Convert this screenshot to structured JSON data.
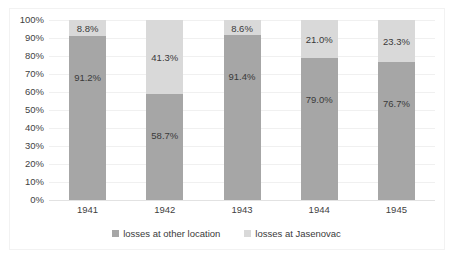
{
  "chart_data": {
    "type": "bar",
    "subtype": "stacked-percent",
    "title": "",
    "subtitle": "",
    "xlabel": "",
    "ylabel": "",
    "categories": [
      "1941",
      "1942",
      "1943",
      "1944",
      "1945"
    ],
    "series": [
      {
        "name": "losses at other location",
        "color": "#a6a6a6",
        "values": [
          91.2,
          58.7,
          91.4,
          79.0,
          76.7
        ],
        "labels": [
          "91.2%",
          "58.7%",
          "91.4%",
          "79.0%",
          "76.7%"
        ]
      },
      {
        "name": "losses at Jasenovac",
        "color": "#d9d9d9",
        "values": [
          8.8,
          41.3,
          8.6,
          21.0,
          23.3
        ],
        "labels": [
          "8.8%",
          "41.3%",
          "8.6%",
          "21.0%",
          "23.3%"
        ]
      }
    ],
    "ylim": [
      0,
      100
    ],
    "yticks": [
      0,
      10,
      20,
      30,
      40,
      50,
      60,
      70,
      80,
      90,
      100
    ],
    "ytick_labels": [
      "0%",
      "10%",
      "20%",
      "30%",
      "40%",
      "50%",
      "60%",
      "70%",
      "80%",
      "90%",
      "100%"
    ],
    "grid": true,
    "grid_axis": "y",
    "legend": true,
    "legend_position": "bottom",
    "legend_entries": [
      "losses at other location",
      "losses at Jasenovac"
    ]
  },
  "colors": {
    "series_bottom": "#a6a6a6",
    "series_top": "#d9d9d9",
    "gridline": "#f0f0f0",
    "axis": "#e2e2e2",
    "text": "#3f3f3f",
    "background": "#ffffff"
  }
}
